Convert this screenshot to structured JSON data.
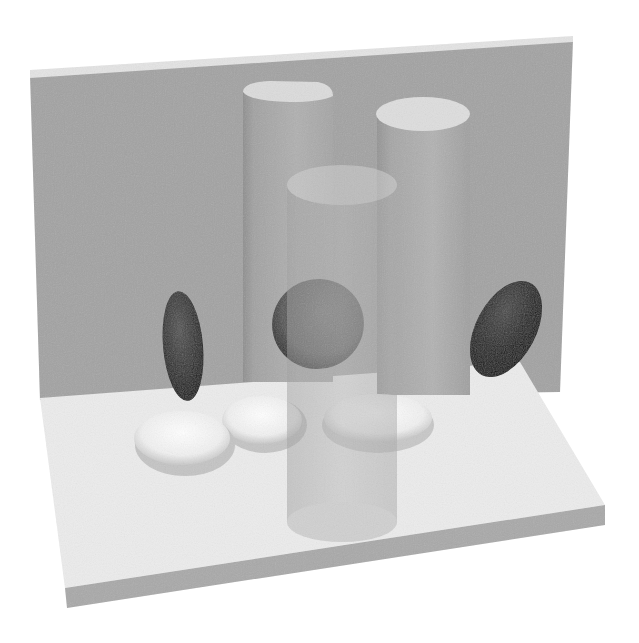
{
  "scene": {
    "description": "Grayscale 3D render of cylinders and disc-shaped objects on an L-shaped backdrop",
    "background_color": "#ffffff",
    "colors": {
      "wall": "#a3a3a3",
      "wall_edge_top": "#e6e6e6",
      "floor_top": "#ececec",
      "floor_edge": "#a8a8a8",
      "cylinder_body": "#a9a9a9",
      "cylinder_top": "#dedede",
      "transparent_cylinder": "#bdbdbd",
      "dark_disc": "#3a3a3a",
      "white_disc": "#f2f2f2"
    },
    "objects": [
      {
        "name": "back-wall",
        "type": "plane"
      },
      {
        "name": "floor-slab",
        "type": "box"
      },
      {
        "name": "left-half-cylinder",
        "type": "cylinder",
        "opacity": "opaque"
      },
      {
        "name": "right-cylinder",
        "type": "cylinder",
        "opacity": "opaque"
      },
      {
        "name": "center-transparent-cylinder",
        "type": "cylinder",
        "opacity": "translucent"
      },
      {
        "name": "left-dark-disc",
        "type": "disc",
        "tone": "dark"
      },
      {
        "name": "center-dark-disc",
        "type": "disc",
        "tone": "dark"
      },
      {
        "name": "right-dark-disc",
        "type": "disc",
        "tone": "dark"
      },
      {
        "name": "left-white-disc-pair",
        "type": "disc",
        "tone": "white",
        "count": 2
      },
      {
        "name": "right-white-disc",
        "type": "disc",
        "tone": "white"
      }
    ]
  }
}
